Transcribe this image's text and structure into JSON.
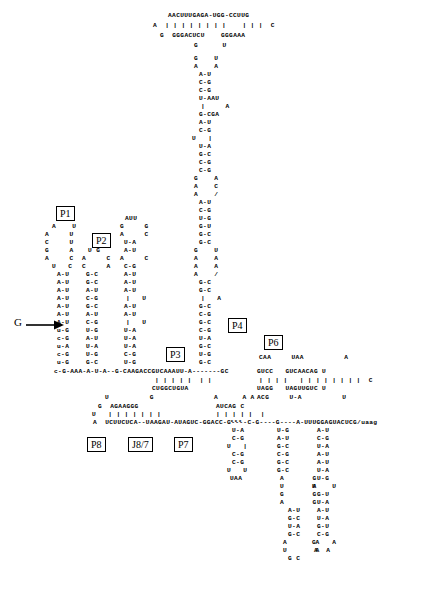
{
  "diagram": {
    "helix_labels": [
      {
        "id": "P1",
        "text": "P1"
      },
      {
        "id": "P2",
        "text": "P2"
      },
      {
        "id": "P3",
        "text": "P3"
      },
      {
        "id": "P4",
        "text": "P4"
      },
      {
        "id": "P6",
        "text": "P6"
      },
      {
        "id": "P7",
        "text": "P7"
      },
      {
        "id": "P8",
        "text": "P8"
      },
      {
        "id": "J8/7",
        "text": "J8/7"
      }
    ],
    "annotations": {
      "g_cofactor": "G",
      "splice_marker": "***"
    },
    "colors": {
      "ink": "#000000",
      "paper": "#ffffff"
    },
    "lines": [
      {
        "id": "t1",
        "x": 168,
        "y": 12,
        "text": "AACUUUGAGA-UGG-CCUUG"
      },
      {
        "id": "t2",
        "x": 153,
        "y": 22,
        "text": "A  | | | | | | | |    | | |  C"
      },
      {
        "id": "t3",
        "x": 160,
        "y": 32,
        "text": "G  GGGACUCU    GGGAAA"
      },
      {
        "id": "t4",
        "x": 194,
        "y": 42,
        "text": "G      U"
      },
      {
        "id": "s1",
        "x": 194,
        "y": 55,
        "text": "G    U"
      },
      {
        "id": "s2",
        "x": 194,
        "y": 63,
        "text": "A    A"
      },
      {
        "id": "s3",
        "x": 199,
        "y": 71,
        "text": "A-U"
      },
      {
        "id": "s4",
        "x": 199,
        "y": 79,
        "text": "C-G"
      },
      {
        "id": "s5",
        "x": 199,
        "y": 87,
        "text": "C-G"
      },
      {
        "id": "s6",
        "x": 199,
        "y": 95,
        "text": "U-AAU"
      },
      {
        "id": "s7",
        "x": 201,
        "y": 103,
        "text": "|     A"
      },
      {
        "id": "s8",
        "x": 199,
        "y": 111,
        "text": "G-CGA"
      },
      {
        "id": "s9",
        "x": 199,
        "y": 119,
        "text": "A-U"
      },
      {
        "id": "s10",
        "x": 199,
        "y": 127,
        "text": "C-G"
      },
      {
        "id": "s11",
        "x": 192,
        "y": 135,
        "text": "U   |"
      },
      {
        "id": "s12",
        "x": 199,
        "y": 143,
        "text": "U-A"
      },
      {
        "id": "s13",
        "x": 199,
        "y": 151,
        "text": "G-C"
      },
      {
        "id": "s14",
        "x": 199,
        "y": 159,
        "text": "C-G"
      },
      {
        "id": "s15",
        "x": 199,
        "y": 167,
        "text": "C-G"
      },
      {
        "id": "s16",
        "x": 194,
        "y": 175,
        "text": "G    A"
      },
      {
        "id": "s17",
        "x": 194,
        "y": 183,
        "text": "A    C"
      },
      {
        "id": "s18",
        "x": 194,
        "y": 191,
        "text": "A    /"
      },
      {
        "id": "s19",
        "x": 199,
        "y": 199,
        "text": "A-U"
      },
      {
        "id": "s20",
        "x": 199,
        "y": 207,
        "text": "C-G"
      },
      {
        "id": "s21",
        "x": 199,
        "y": 215,
        "text": "U-G"
      },
      {
        "id": "s22",
        "x": 199,
        "y": 223,
        "text": "G-U"
      },
      {
        "id": "s23",
        "x": 199,
        "y": 231,
        "text": "G-C"
      },
      {
        "id": "s24",
        "x": 199,
        "y": 239,
        "text": "G-C"
      },
      {
        "id": "s25",
        "x": 194,
        "y": 247,
        "text": "G    U"
      },
      {
        "id": "s26",
        "x": 194,
        "y": 255,
        "text": "A    A"
      },
      {
        "id": "s27",
        "x": 194,
        "y": 263,
        "text": "A    A"
      },
      {
        "id": "s28",
        "x": 194,
        "y": 271,
        "text": "A    /"
      },
      {
        "id": "s29",
        "x": 199,
        "y": 279,
        "text": "G-C"
      },
      {
        "id": "s30",
        "x": 199,
        "y": 287,
        "text": "G-C"
      },
      {
        "id": "s31",
        "x": 201,
        "y": 295,
        "text": "|   A"
      },
      {
        "id": "s32",
        "x": 199,
        "y": 303,
        "text": "G-C"
      },
      {
        "id": "s33",
        "x": 199,
        "y": 311,
        "text": "C-G"
      },
      {
        "id": "s34",
        "x": 199,
        "y": 319,
        "text": "G-C"
      },
      {
        "id": "s35",
        "x": 199,
        "y": 327,
        "text": "C-G"
      },
      {
        "id": "s36",
        "x": 199,
        "y": 335,
        "text": "U-A"
      },
      {
        "id": "s37",
        "x": 199,
        "y": 343,
        "text": "G-C"
      },
      {
        "id": "s38",
        "x": 199,
        "y": 351,
        "text": "U-G"
      },
      {
        "id": "s39",
        "x": 199,
        "y": 359,
        "text": "G-C"
      },
      {
        "id": "l1",
        "x": 60,
        "y": 215,
        "text": "U A"
      },
      {
        "id": "l2",
        "x": 125,
        "y": 215,
        "text": "AUU"
      },
      {
        "id": "l3",
        "x": 52,
        "y": 223,
        "text": "A    U"
      },
      {
        "id": "l4",
        "x": 120,
        "y": 223,
        "text": "G     G"
      },
      {
        "id": "l5",
        "x": 45,
        "y": 231,
        "text": "A     U"
      },
      {
        "id": "l6",
        "x": 120,
        "y": 231,
        "text": "A     C"
      },
      {
        "id": "l7",
        "x": 45,
        "y": 239,
        "text": "C     U"
      },
      {
        "id": "l8",
        "x": 124,
        "y": 239,
        "text": "U-A"
      },
      {
        "id": "l9",
        "x": 45,
        "y": 247,
        "text": "G     A"
      },
      {
        "id": "l10",
        "x": 88,
        "y": 247,
        "text": "U G"
      },
      {
        "id": "l11",
        "x": 124,
        "y": 247,
        "text": "A-U"
      },
      {
        "id": "l12",
        "x": 45,
        "y": 255,
        "text": "A     C"
      },
      {
        "id": "l13",
        "x": 82,
        "y": 255,
        "text": "A     C"
      },
      {
        "id": "l14",
        "x": 120,
        "y": 255,
        "text": "A     C"
      },
      {
        "id": "l15",
        "x": 52,
        "y": 263,
        "text": "U   C"
      },
      {
        "id": "l16",
        "x": 82,
        "y": 263,
        "text": "C     A"
      },
      {
        "id": "l17",
        "x": 124,
        "y": 263,
        "text": "C-G"
      },
      {
        "id": "l18",
        "x": 57,
        "y": 271,
        "text": "A-U"
      },
      {
        "id": "l19",
        "x": 86,
        "y": 271,
        "text": "G-C"
      },
      {
        "id": "l20",
        "x": 124,
        "y": 271,
        "text": "A-U"
      },
      {
        "id": "l21",
        "x": 57,
        "y": 279,
        "text": "A-U"
      },
      {
        "id": "l22",
        "x": 86,
        "y": 279,
        "text": "G-C"
      },
      {
        "id": "l23",
        "x": 124,
        "y": 279,
        "text": "A-U"
      },
      {
        "id": "l24",
        "x": 57,
        "y": 287,
        "text": "A-U"
      },
      {
        "id": "l25",
        "x": 86,
        "y": 287,
        "text": "A-U"
      },
      {
        "id": "l26",
        "x": 124,
        "y": 287,
        "text": "A-U"
      },
      {
        "id": "l27",
        "x": 57,
        "y": 295,
        "text": "A-U"
      },
      {
        "id": "l28",
        "x": 86,
        "y": 295,
        "text": "C-G"
      },
      {
        "id": "l29",
        "x": 126,
        "y": 295,
        "text": "|   U"
      },
      {
        "id": "l30",
        "x": 57,
        "y": 303,
        "text": "A-U"
      },
      {
        "id": "l31",
        "x": 86,
        "y": 303,
        "text": "G-C"
      },
      {
        "id": "l32",
        "x": 124,
        "y": 303,
        "text": "A-U"
      },
      {
        "id": "l33",
        "x": 57,
        "y": 311,
        "text": "A-U"
      },
      {
        "id": "l34",
        "x": 86,
        "y": 311,
        "text": "A-U"
      },
      {
        "id": "l35",
        "x": 124,
        "y": 311,
        "text": "A-U"
      },
      {
        "id": "l36",
        "x": 57,
        "y": 319,
        "text": "A-U"
      },
      {
        "id": "l37",
        "x": 86,
        "y": 319,
        "text": "C-G"
      },
      {
        "id": "l38",
        "x": 126,
        "y": 319,
        "text": "|   U"
      },
      {
        "id": "l39",
        "x": 57,
        "y": 327,
        "text": "u-G"
      },
      {
        "id": "l40",
        "x": 86,
        "y": 327,
        "text": "U-G"
      },
      {
        "id": "l41",
        "x": 124,
        "y": 327,
        "text": "U-A"
      },
      {
        "id": "l42",
        "x": 57,
        "y": 335,
        "text": "c-G"
      },
      {
        "id": "l43",
        "x": 86,
        "y": 335,
        "text": "A-U"
      },
      {
        "id": "l44",
        "x": 124,
        "y": 335,
        "text": "U-A"
      },
      {
        "id": "l45",
        "x": 57,
        "y": 343,
        "text": "u-A"
      },
      {
        "id": "l46",
        "x": 86,
        "y": 343,
        "text": "U-A"
      },
      {
        "id": "l47",
        "x": 124,
        "y": 343,
        "text": "U-A"
      },
      {
        "id": "l48",
        "x": 57,
        "y": 351,
        "text": "c-G"
      },
      {
        "id": "l49",
        "x": 86,
        "y": 351,
        "text": "U-G"
      },
      {
        "id": "l50",
        "x": 124,
        "y": 351,
        "text": "C-G"
      },
      {
        "id": "l51",
        "x": 57,
        "y": 359,
        "text": "u-G"
      },
      {
        "id": "l52",
        "x": 86,
        "y": 359,
        "text": "G-C"
      },
      {
        "id": "l53",
        "x": 124,
        "y": 359,
        "text": "U-G"
      },
      {
        "id": "b1",
        "x": 54,
        "y": 368,
        "text": "c-G-AAA-A-U-A--G-CAAGACCGUCAAAUU-A-------GC"
      },
      {
        "id": "b2",
        "x": 155,
        "y": 377,
        "text": "| | | | |  | |"
      },
      {
        "id": "b3",
        "x": 152,
        "y": 385,
        "text": "CUGGCUGUA"
      },
      {
        "id": "p6a",
        "x": 259,
        "y": 354,
        "text": "CAA     UAA          A"
      },
      {
        "id": "p6b",
        "x": 257,
        "y": 368,
        "text": "GUCC   GUCAACAG U"
      },
      {
        "id": "p6c",
        "x": 259,
        "y": 377,
        "text": "| | | |   | | | | | | | |  C"
      },
      {
        "id": "p6d",
        "x": 257,
        "y": 385,
        "text": "UAGG   UAGUUGUC U"
      },
      {
        "id": "p6e",
        "x": 257,
        "y": 394,
        "text": "ACG     U-A          U"
      },
      {
        "id": "c1",
        "x": 105,
        "y": 394,
        "text": "U          G"
      },
      {
        "id": "c2",
        "x": 214,
        "y": 394,
        "text": "A      A A"
      },
      {
        "id": "c3",
        "x": 98,
        "y": 403,
        "text": "G  AGAAGGG"
      },
      {
        "id": "c4",
        "x": 216,
        "y": 403,
        "text": "AUCAG C"
      },
      {
        "id": "c5",
        "x": 92,
        "y": 411,
        "text": "U   | | | | | | |"
      },
      {
        "id": "c6",
        "x": 216,
        "y": 411,
        "text": "| | | | |  |"
      },
      {
        "id": "c7",
        "x": 93,
        "y": 419,
        "text": "A  UCUUCUCA--UAAGAU-AUAGUC-GGACC-G----C-G----G----A-UUUGGAGUACUCG/uaag"
      },
      {
        "id": "r1",
        "x": 230,
        "y": 419,
        "text": "***"
      },
      {
        "id": "r2",
        "x": 232,
        "y": 427,
        "text": "U-A"
      },
      {
        "id": "r3",
        "x": 277,
        "y": 427,
        "text": "U-G"
      },
      {
        "id": "r4",
        "x": 317,
        "y": 427,
        "text": "A-U"
      },
      {
        "id": "r5",
        "x": 232,
        "y": 435,
        "text": "C-G"
      },
      {
        "id": "r6",
        "x": 277,
        "y": 435,
        "text": "A-U"
      },
      {
        "id": "r7",
        "x": 317,
        "y": 435,
        "text": "C-G"
      },
      {
        "id": "r8",
        "x": 227,
        "y": 443,
        "text": "U   |"
      },
      {
        "id": "r9",
        "x": 277,
        "y": 443,
        "text": "G-C"
      },
      {
        "id": "r10",
        "x": 317,
        "y": 443,
        "text": "U-A"
      },
      {
        "id": "r11",
        "x": 232,
        "y": 451,
        "text": "C-G"
      },
      {
        "id": "r12",
        "x": 277,
        "y": 451,
        "text": "C-G"
      },
      {
        "id": "r13",
        "x": 317,
        "y": 451,
        "text": "A-U"
      },
      {
        "id": "r14",
        "x": 232,
        "y": 459,
        "text": "C-G"
      },
      {
        "id": "r15",
        "x": 277,
        "y": 459,
        "text": "G-C"
      },
      {
        "id": "r16",
        "x": 317,
        "y": 459,
        "text": "A-U"
      },
      {
        "id": "r17",
        "x": 227,
        "y": 467,
        "text": "U   U"
      },
      {
        "id": "r18",
        "x": 277,
        "y": 467,
        "text": "G-C"
      },
      {
        "id": "r19",
        "x": 317,
        "y": 467,
        "text": "U-A"
      },
      {
        "id": "r20",
        "x": 230,
        "y": 475,
        "text": "UAA"
      },
      {
        "id": "r21",
        "x": 280,
        "y": 475,
        "text": "A       G"
      },
      {
        "id": "r22",
        "x": 317,
        "y": 475,
        "text": "U-G"
      },
      {
        "id": "r23",
        "x": 280,
        "y": 483,
        "text": "U       A"
      },
      {
        "id": "r24",
        "x": 312,
        "y": 483,
        "text": "U    U"
      },
      {
        "id": "r25",
        "x": 280,
        "y": 491,
        "text": "G       G"
      },
      {
        "id": "r26",
        "x": 317,
        "y": 491,
        "text": "G-U"
      },
      {
        "id": "r27",
        "x": 280,
        "y": 499,
        "text": "A       G"
      },
      {
        "id": "r28",
        "x": 317,
        "y": 499,
        "text": "U-A"
      },
      {
        "id": "r29",
        "x": 288,
        "y": 507,
        "text": "A-U"
      },
      {
        "id": "r30",
        "x": 317,
        "y": 507,
        "text": "A-U"
      },
      {
        "id": "r31",
        "x": 288,
        "y": 515,
        "text": "G-C"
      },
      {
        "id": "r32",
        "x": 317,
        "y": 515,
        "text": "U-A"
      },
      {
        "id": "r33",
        "x": 288,
        "y": 523,
        "text": "U-A"
      },
      {
        "id": "r34",
        "x": 317,
        "y": 523,
        "text": "G-U"
      },
      {
        "id": "r35",
        "x": 288,
        "y": 531,
        "text": "G-C"
      },
      {
        "id": "r36",
        "x": 317,
        "y": 531,
        "text": "C-G"
      },
      {
        "id": "r37",
        "x": 283,
        "y": 539,
        "text": "A       A"
      },
      {
        "id": "r38",
        "x": 312,
        "y": 539,
        "text": "G    A"
      },
      {
        "id": "r39",
        "x": 283,
        "y": 547,
        "text": "U       A"
      },
      {
        "id": "r40",
        "x": 314,
        "y": 547,
        "text": "A  A"
      },
      {
        "id": "r41",
        "x": 288,
        "y": 555,
        "text": "G C"
      }
    ],
    "label_positions": [
      {
        "id": "P1",
        "x": 56,
        "y": 206
      },
      {
        "id": "P2",
        "x": 92,
        "y": 233
      },
      {
        "id": "P3",
        "x": 166,
        "y": 347
      },
      {
        "id": "P4",
        "x": 228,
        "y": 318
      },
      {
        "id": "P6",
        "x": 264,
        "y": 335
      },
      {
        "id": "P7",
        "x": 174,
        "y": 437
      },
      {
        "id": "P8",
        "x": 87,
        "y": 437
      },
      {
        "id": "J8/7",
        "x": 128,
        "y": 437
      }
    ]
  }
}
